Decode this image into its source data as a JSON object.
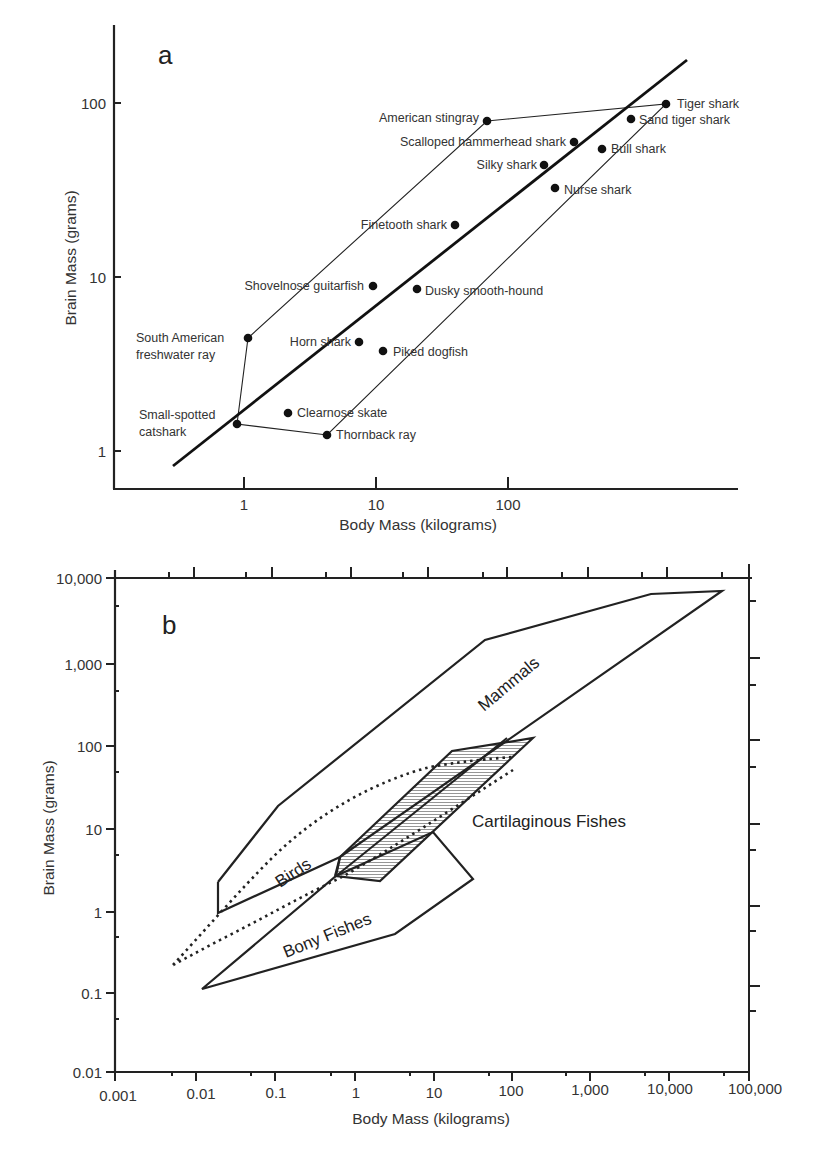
{
  "chart_data": [
    {
      "panel": "a",
      "type": "scatter",
      "title": "",
      "xlabel": "Body Mass (kilograms)",
      "ylabel": "Brain Mass (grams)",
      "xscale": "log",
      "yscale": "log",
      "xticks": [
        "1",
        "10",
        "100"
      ],
      "yticks": [
        "1",
        "10",
        "100"
      ],
      "xlim": [
        0.1,
        500
      ],
      "ylim": [
        0.6,
        250
      ],
      "grid": false,
      "points": [
        {
          "name": "American stingray",
          "x": 17,
          "y": 80
        },
        {
          "name": "Tiger shark",
          "x": 200,
          "y": 100
        },
        {
          "name": "Sand tiger shark",
          "x": 120,
          "y": 82
        },
        {
          "name": "Scalloped hammerhead shark",
          "x": 55,
          "y": 60
        },
        {
          "name": "Bull shark",
          "x": 80,
          "y": 55
        },
        {
          "name": "Silky shark",
          "x": 37,
          "y": 45
        },
        {
          "name": "Nurse shark",
          "x": 43,
          "y": 33
        },
        {
          "name": "Finetooth shark",
          "x": 11,
          "y": 20
        },
        {
          "name": "Shovelnose guitarfish",
          "x": 3.5,
          "y": 9
        },
        {
          "name": "Dusky smooth-hound",
          "x": 6.5,
          "y": 8.7
        },
        {
          "name": "South American freshwater ray",
          "x": 0.62,
          "y": 4.5
        },
        {
          "name": "Horn shark",
          "x": 2.9,
          "y": 4.2
        },
        {
          "name": "Piked dogfish",
          "x": 4.1,
          "y": 3.8
        },
        {
          "name": "Clearnose skate",
          "x": 1.1,
          "y": 1.65
        },
        {
          "name": "Small-spotted catshark",
          "x": 0.53,
          "y": 1.45
        },
        {
          "name": "Thornback ray",
          "x": 1.85,
          "y": 1.2
        }
      ],
      "regression_line": {
        "x": [
          0.22,
          200
        ],
        "y": [
          0.8,
          180
        ]
      },
      "envelope": [
        "American stingray",
        "Tiger shark",
        "Thornback ray",
        "Small-spotted catshark",
        "South American freshwater ray"
      ],
      "labels": {
        "panel_letter": "a",
        "xlabel": "Body Mass (kilograms)",
        "ylabel": "Brain Mass (grams)",
        "xtick_1": "1",
        "xtick_10": "10",
        "xtick_100": "100",
        "ytick_1": "1",
        "ytick_10": "10",
        "ytick_100": "100"
      }
    },
    {
      "panel": "b",
      "type": "area",
      "title": "",
      "xlabel": "Body Mass (kilograms)",
      "ylabel": "Brain Mass (grams)",
      "xscale": "log",
      "yscale": "log",
      "xticks": [
        "0.001",
        "0.01",
        "0.1",
        "1",
        "10",
        "100",
        "1,000",
        "10,000",
        "100,000"
      ],
      "yticks": [
        "0.01",
        "0.1",
        "1",
        "10",
        "100",
        "1,000",
        "10,000"
      ],
      "xlim": [
        0.001,
        100000
      ],
      "ylim": [
        0.01,
        10000
      ],
      "grid": false,
      "regions": [
        {
          "name": "Mammals",
          "style": "solid outline"
        },
        {
          "name": "Birds",
          "style": "solid/dotted outline"
        },
        {
          "name": "Cartilaginous Fishes",
          "style": "hatched fill"
        },
        {
          "name": "Bony Fishes",
          "style": "solid outline"
        }
      ],
      "labels": {
        "panel_letter": "b",
        "xlabel": "Body Mass (kilograms)",
        "ylabel": "Brain Mass (grams)",
        "mammals": "Mammals",
        "birds": "Birds",
        "cartilaginous": "Cartilaginous Fishes",
        "bony": "Bony Fishes",
        "xticks": [
          "0.001",
          "0.01",
          "0.1",
          "1",
          "10",
          "100",
          "1,000",
          "10,000",
          "100,000"
        ],
        "yticks": [
          "0.01",
          "0.1",
          "1",
          "10",
          "100",
          "1,000",
          "10,000"
        ]
      }
    }
  ]
}
